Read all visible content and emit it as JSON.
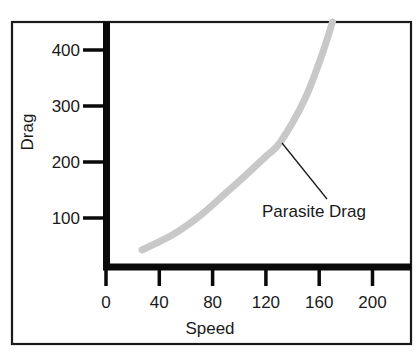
{
  "chart_data": {
    "type": "line",
    "title": "",
    "xlabel": "Speed",
    "ylabel": "Drag",
    "xlim": [
      0,
      220
    ],
    "ylim": [
      0,
      450
    ],
    "x_ticks": [
      0,
      40,
      80,
      120,
      160,
      200
    ],
    "y_ticks": [
      100,
      200,
      300,
      400
    ],
    "x_tick_labels": [
      "0",
      "40",
      "80",
      "120",
      "160",
      "200"
    ],
    "y_tick_labels": [
      "100",
      "200",
      "300",
      "400"
    ],
    "grid": false,
    "legend": null,
    "series": [
      {
        "name": "Parasite Drag",
        "color": "#c8c8c8",
        "x": [
          27,
          50,
          71,
          90,
          101,
          120,
          131,
          149,
          162,
          170
        ],
        "y": [
          43,
          70,
          105,
          145,
          168,
          210,
          236,
          311,
          391,
          450
        ]
      }
    ],
    "annotations": [
      {
        "text": "Parasite Drag",
        "target_series": "Parasite Drag",
        "pointer": "leader-line"
      }
    ]
  }
}
